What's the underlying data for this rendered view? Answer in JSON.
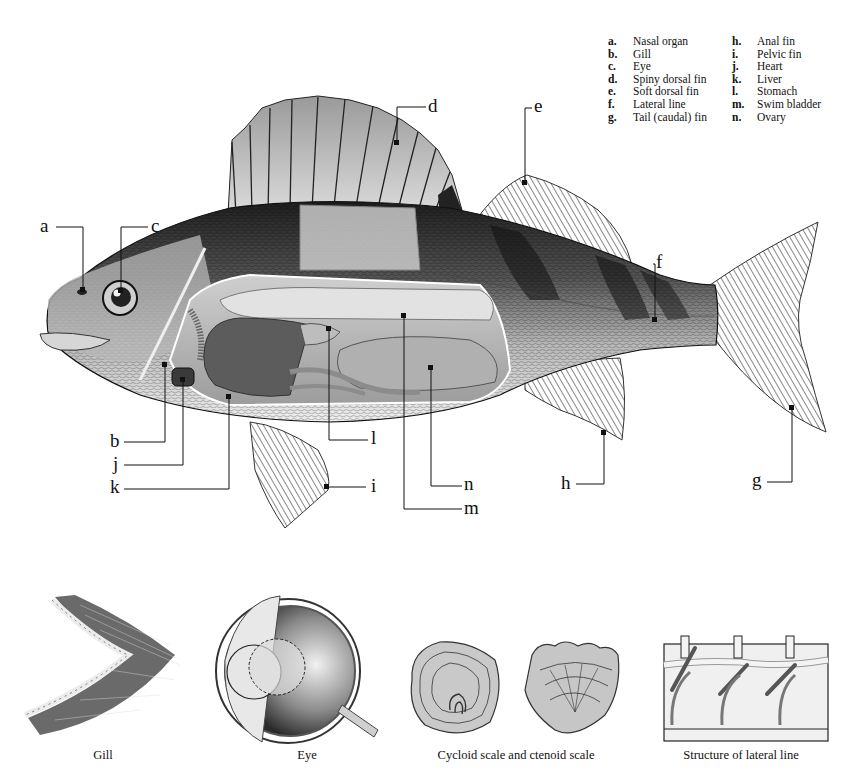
{
  "legend": {
    "left_column": [
      {
        "key": "a.",
        "label": "Nasal organ"
      },
      {
        "key": "b.",
        "label": "Gill"
      },
      {
        "key": "c.",
        "label": "Eye"
      },
      {
        "key": "d.",
        "label": "Spiny dorsal fin"
      },
      {
        "key": "e.",
        "label": "Soft dorsal fin"
      },
      {
        "key": "f.",
        "label": "Lateral line"
      },
      {
        "key": "g.",
        "label": "Tail (caudal) fin"
      }
    ],
    "right_column": [
      {
        "key": "h.",
        "label": "Anal fin"
      },
      {
        "key": "i.",
        "label": "Pelvic fin"
      },
      {
        "key": "j.",
        "label": "Heart"
      },
      {
        "key": "k.",
        "label": "Liver"
      },
      {
        "key": "l.",
        "label": "Stomach"
      },
      {
        "key": "m.",
        "label": "Swim bladder"
      },
      {
        "key": "n.",
        "label": "Ovary"
      }
    ]
  },
  "callouts": {
    "a": "a",
    "b": "b",
    "c": "c",
    "d": "d",
    "e": "e",
    "f": "f",
    "g": "g",
    "h": "h",
    "i": "i",
    "j": "j",
    "k": "k",
    "l": "l",
    "m": "m",
    "n": "n"
  },
  "captions": {
    "gill": "Gill",
    "eye": "Eye",
    "scales": "Cycloid scale and ctenoid scale",
    "lateral_line": "Structure of lateral line"
  },
  "colors": {
    "ink": "#111111",
    "background": "#ffffff",
    "body_dark": "#3a3a3a",
    "body_mid": "#8a8a8a",
    "body_light": "#d8d8d8",
    "organ": "#9a9a9a",
    "organ_dark": "#5c5c5c"
  }
}
